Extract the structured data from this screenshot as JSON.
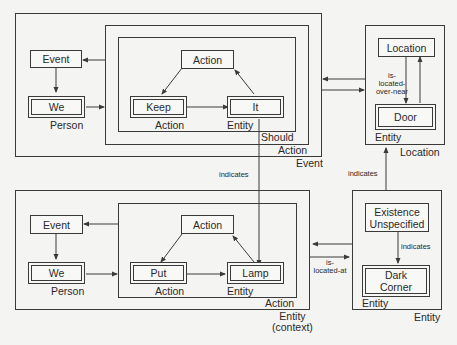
{
  "top_left": {
    "outer_frame_label": "Event",
    "middle_frame_label": "Action",
    "inner_frame_label": "Should",
    "event_node": "Event",
    "we_node": "We",
    "we_type": "Person",
    "action_node": "Action",
    "keep_node": "Keep",
    "keep_type": "Action",
    "it_node": "It",
    "it_type": "Entity"
  },
  "top_right": {
    "frame_label": "Location",
    "location_node": "Location",
    "door_node": "Door",
    "door_type": "Entity",
    "relation_label": "is-\nlocated-\nover-near"
  },
  "bottom_left": {
    "outer_frame_label": "Entity\n(context)",
    "inner_frame_label": "Action",
    "event_node": "Event",
    "we_node": "We",
    "we_type": "Person",
    "action_node": "Action",
    "put_node": "Put",
    "put_type": "Action",
    "lamp_node": "Lamp",
    "lamp_type": "Entity"
  },
  "bottom_right": {
    "frame_label": "Entity",
    "existence_node": "Existence\nUnspecified",
    "indicates_label": "indicates",
    "dark_corner_node": "Dark\nCorner",
    "dark_corner_type": "Entity",
    "relation_label": "is-\nlocated-at"
  },
  "connectors": {
    "it_to_lamp_label": "indicates",
    "location_to_entity_label": "indicates"
  }
}
